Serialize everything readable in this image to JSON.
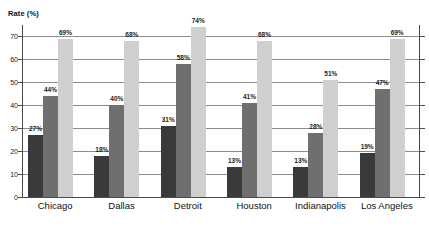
{
  "chart_data": {
    "type": "bar",
    "title": "",
    "xlabel": "",
    "ylabel": "Rate (%)",
    "ylim": [
      0,
      75
    ],
    "yticks": [
      0,
      10,
      20,
      30,
      40,
      50,
      60,
      70
    ],
    "ytick_labels": [
      "0",
      "10",
      "20",
      "30",
      "40",
      "50",
      "60",
      "70"
    ],
    "grid": true,
    "legend": "none",
    "categories": [
      "Chicago",
      "Dallas",
      "Detroit",
      "Houston",
      "Indianapolis",
      "Los Angeles"
    ],
    "series": [
      {
        "name": "series-1",
        "color": "#3a3a3a",
        "values": [
          27,
          18,
          31,
          13,
          13,
          19
        ],
        "labels": [
          "27%",
          "18%",
          "31%",
          "13%",
          "13%",
          "19%"
        ]
      },
      {
        "name": "series-2",
        "color": "#6f6f6f",
        "values": [
          44,
          40,
          58,
          41,
          28,
          47
        ],
        "labels": [
          "44%",
          "40%",
          "58%",
          "41%",
          "28%",
          "47%"
        ]
      },
      {
        "name": "series-3",
        "color": "#cfcfcf",
        "values": [
          69,
          68,
          74,
          68,
          51,
          69
        ],
        "labels": [
          "69%",
          "68%",
          "74%",
          "68%",
          "51%",
          "69%"
        ]
      }
    ]
  },
  "axis": {
    "y_title": "Rate (%)",
    "line_color": "#4a4a4a",
    "grid_color": "#8d8d8d"
  }
}
